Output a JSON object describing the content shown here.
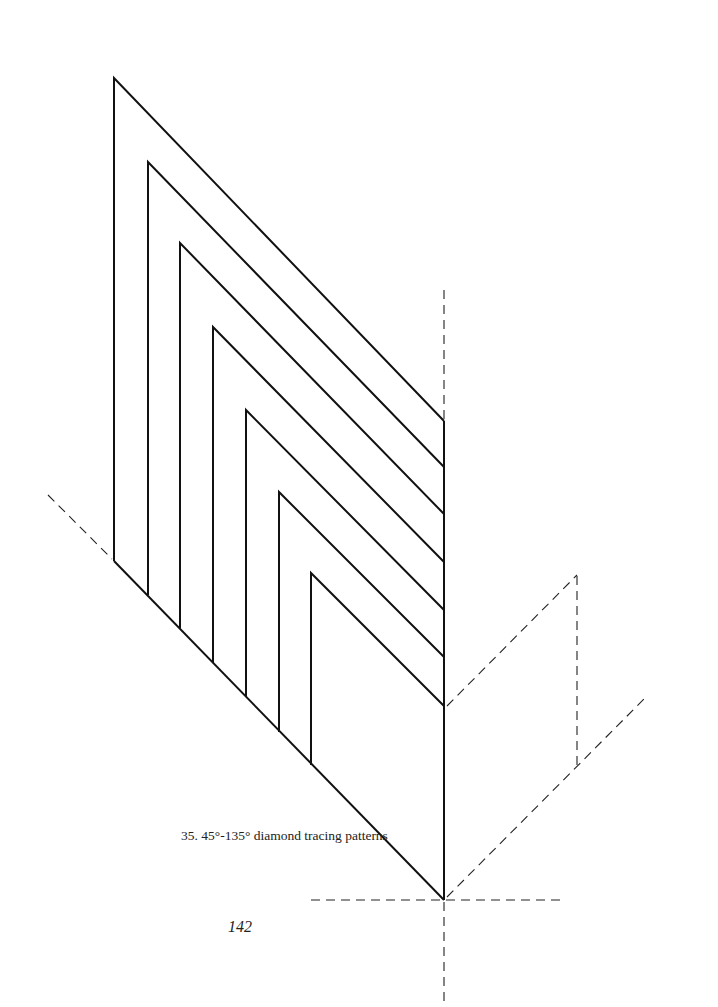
{
  "figure": {
    "caption": "35.  45°-135° diamond tracing patterns",
    "number": "35",
    "title": "45°-135° diamond tracing patterns"
  },
  "page": {
    "number": "142"
  },
  "colors": {
    "ink": "#111111",
    "background": "#ffffff"
  },
  "diagram": {
    "right_vertical_x": 444,
    "bottom_vertex": [
      444,
      900
    ],
    "chevrons": [
      {
        "x": 114,
        "top": 78,
        "bottom": 561,
        "right_y": 421
      },
      {
        "x": 148,
        "top": 162,
        "bottom": 595,
        "right_y": 467
      },
      {
        "x": 180,
        "top": 243,
        "bottom": 628,
        "right_y": 514
      },
      {
        "x": 213,
        "top": 327,
        "bottom": 663,
        "right_y": 562
      },
      {
        "x": 246,
        "top": 410,
        "bottom": 697,
        "right_y": 610
      },
      {
        "x": 279,
        "top": 492,
        "bottom": 732,
        "right_y": 657
      },
      {
        "x": 311,
        "top": 573,
        "bottom": 765,
        "right_y": 706
      }
    ]
  }
}
